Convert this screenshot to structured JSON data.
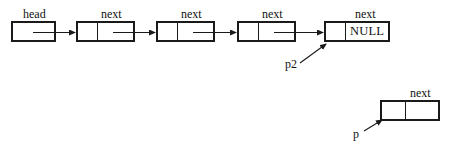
{
  "diagram": {
    "stroke_color": "#1a1a1a",
    "background_color": "#ffffff",
    "head_box": {
      "label": "head",
      "text": ""
    },
    "nodes": [
      {
        "id": "node-1",
        "next_label": "next",
        "data_text": "",
        "next_text": ""
      },
      {
        "id": "node-2",
        "next_label": "next",
        "data_text": "",
        "next_text": ""
      },
      {
        "id": "node-3",
        "next_label": "next",
        "data_text": "",
        "next_text": ""
      },
      {
        "id": "node-4",
        "next_label": "next",
        "data_text": "",
        "next_text": "NULL"
      }
    ],
    "detached_node": {
      "id": "node-detached",
      "next_label": "next",
      "data_text": "",
      "next_text": ""
    },
    "pointers": [
      {
        "name": "p2",
        "label": "p2",
        "target": "node-4"
      },
      {
        "name": "p",
        "label": "p",
        "target": "node-detached"
      }
    ]
  }
}
